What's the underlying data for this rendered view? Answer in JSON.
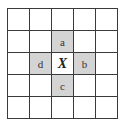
{
  "diagram": {
    "rows": 5,
    "cols": 5,
    "shade_color": "#d4d4d4",
    "cells": [
      [
        "",
        "",
        "",
        "",
        ""
      ],
      [
        "",
        "",
        "a",
        "",
        ""
      ],
      [
        "",
        "d",
        "X",
        "b",
        ""
      ],
      [
        "",
        "",
        "c",
        "",
        ""
      ],
      [
        "",
        "",
        "",
        "",
        ""
      ]
    ],
    "shaded": [
      [
        1,
        2
      ],
      [
        2,
        1
      ],
      [
        2,
        3
      ],
      [
        3,
        2
      ]
    ],
    "center": [
      2,
      2
    ]
  }
}
